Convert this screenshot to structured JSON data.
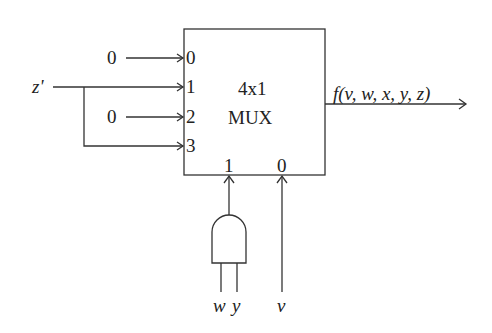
{
  "mux": {
    "title_line1": "4x1",
    "title_line2": "MUX",
    "data_input_labels": [
      "0",
      "1",
      "2",
      "3"
    ],
    "select_labels": [
      "1",
      "0"
    ]
  },
  "inputs": {
    "i0_value": "0",
    "i1_signal": "z'",
    "i2_value": "0",
    "i3_note": "connected to z'"
  },
  "and_gate": {
    "inputs": [
      "w",
      "y"
    ]
  },
  "select0_input": "v",
  "output": {
    "label": "f(v, w, x, y, z)"
  },
  "colors": {
    "line": "#333333",
    "background": "#ffffff"
  }
}
